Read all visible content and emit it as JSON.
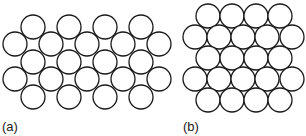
{
  "panels": [
    {
      "label": "(a)",
      "packing": "square",
      "label_pos": [
        2,
        119
      ],
      "radius": 12,
      "rows": [
        {
          "y": 27,
          "xs": [
            33,
            69,
            105,
            141
          ]
        },
        {
          "y": 44,
          "xs": [
            15,
            51,
            87,
            123,
            159
          ]
        },
        {
          "y": 62,
          "xs": [
            33,
            69,
            105,
            141
          ]
        },
        {
          "y": 79,
          "xs": [
            15,
            51,
            87,
            123,
            159
          ]
        },
        {
          "y": 97,
          "xs": [
            33,
            69,
            105,
            141
          ]
        }
      ]
    },
    {
      "label": "(b)",
      "packing": "hexagonal",
      "label_pos": [
        183,
        119
      ],
      "radius": 12,
      "rows": [
        {
          "y": 16,
          "xs": [
            208,
            232,
            256,
            280
          ]
        },
        {
          "y": 37,
          "xs": [
            195,
            219,
            243,
            267,
            292
          ]
        },
        {
          "y": 58,
          "xs": [
            208,
            232,
            256,
            280
          ]
        },
        {
          "y": 79,
          "xs": [
            195,
            219,
            243,
            267,
            292
          ]
        },
        {
          "y": 100,
          "xs": [
            208,
            232,
            256,
            280
          ]
        }
      ]
    }
  ],
  "colors": {
    "stroke": "#1a1a1a",
    "fill": "#ffffff"
  }
}
